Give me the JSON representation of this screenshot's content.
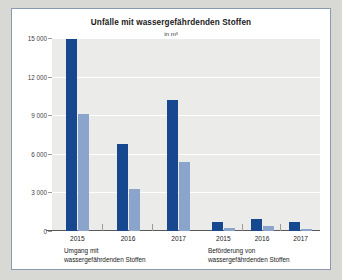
{
  "chart_data": {
    "type": "bar",
    "title": "Unfälle mit wassergefährdenden Stoffen",
    "subtitle": "in m³",
    "xlabel": "",
    "ylabel": "",
    "ylim": [
      0,
      15000
    ],
    "yticks": [
      15000,
      12000,
      9000,
      6000,
      3000,
      0
    ],
    "ytick_labels": [
      "15 000",
      "12 000",
      "9 000",
      "6 000",
      "3 000",
      "0"
    ],
    "grid": true,
    "legend_position": "top-right",
    "legend": [
      "Freigesetztes Volumen",
      "Nicht wiedergewonnenes Volumen"
    ],
    "colors": {
      "freigesetztes_volumen": "#17478f",
      "nicht_wiedergewonnenes_volumen": "#8ba4cc",
      "plot_background": "#ebebe9",
      "panel_background": "#ffffff",
      "page_background": "#d8d8d4"
    },
    "groups": [
      {
        "label": "Umgang mit wassergefährdenden Stoffen",
        "label_line1": "Umgang mit",
        "label_line2": "wassergefährdenden Stoffen",
        "categories": [
          "2015",
          "2016",
          "2017"
        ],
        "series": [
          {
            "name": "Freigesetztes Volumen",
            "values": [
              14900,
              6800,
              10200
            ]
          },
          {
            "name": "Nicht wiedergewonnenes Volumen",
            "values": [
              9100,
              3300,
              5400
            ]
          }
        ]
      },
      {
        "label": "Beförderung von wassergefährdenden Stoffen",
        "label_line1": "Beförderung von",
        "label_line2": "wassergefährdenden Stoffen",
        "categories": [
          "2015",
          "2016",
          "2017"
        ],
        "series": [
          {
            "name": "Freigesetztes Volumen",
            "values": [
              700,
              900,
              700
            ]
          },
          {
            "name": "Nicht wiedergewonnenes Volumen",
            "values": [
              200,
              400,
              150
            ]
          }
        ]
      }
    ]
  }
}
